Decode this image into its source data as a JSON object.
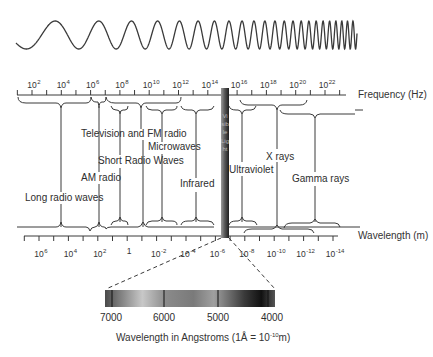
{
  "diagram": {
    "frequency_axis": {
      "label": "Frequency (Hz)",
      "ticks": [
        {
          "base": "10",
          "exp": "2"
        },
        {
          "base": "10",
          "exp": "4"
        },
        {
          "base": "10",
          "exp": "6"
        },
        {
          "base": "10",
          "exp": "8"
        },
        {
          "base": "10",
          "exp": "10"
        },
        {
          "base": "10",
          "exp": "12"
        },
        {
          "base": "10",
          "exp": "14"
        },
        {
          "base": "10",
          "exp": "16"
        },
        {
          "base": "10",
          "exp": "18"
        },
        {
          "base": "10",
          "exp": "20"
        },
        {
          "base": "10",
          "exp": "22"
        }
      ]
    },
    "wavelength_axis": {
      "label": "Wavelength (m)",
      "ticks": [
        {
          "base": "10",
          "exp": "6"
        },
        {
          "base": "10",
          "exp": "4"
        },
        {
          "base": "10",
          "exp": "2"
        },
        {
          "base": "1",
          "exp": ""
        },
        {
          "base": "10",
          "exp": "-2"
        },
        {
          "base": "10",
          "exp": "-4"
        },
        {
          "base": "10",
          "exp": "-6"
        },
        {
          "base": "10",
          "exp": "-8"
        },
        {
          "base": "10",
          "exp": "-10"
        },
        {
          "base": "10",
          "exp": "-12"
        },
        {
          "base": "10",
          "exp": "-14"
        }
      ]
    },
    "bands": [
      {
        "name": "Long radio waves"
      },
      {
        "name": "AM radio"
      },
      {
        "name": "Short Radio Waves"
      },
      {
        "name": "Television and FM radio"
      },
      {
        "name": "Microwaves"
      },
      {
        "name": "Infrared"
      },
      {
        "name": "Visible Light"
      },
      {
        "name": "Ultraviolet"
      },
      {
        "name": "X rays"
      },
      {
        "name": "Gamma rays"
      }
    ],
    "visible_scale": {
      "labels": [
        "7000",
        "6000",
        "5000",
        "4000"
      ],
      "caption_prefix": "Wavelength in Angstroms (1Å = 10",
      "caption_exp": "-10",
      "caption_suffix": "m)"
    },
    "colors": {
      "line": "#3a3a3a",
      "text": "#2e2e2e",
      "visible_band_dark": "#2a2a2a",
      "visible_band_light": "#9a9a9a"
    }
  }
}
